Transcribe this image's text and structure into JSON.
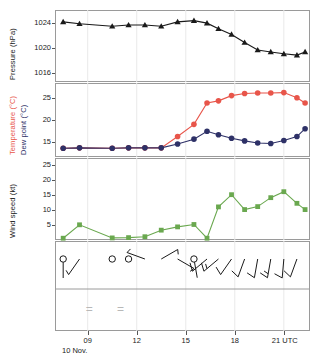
{
  "chart_data": {
    "type": "line",
    "title": "",
    "xlabel": "10 Nov.",
    "x_unit": "UTC",
    "x_tick_labels": [
      "09",
      "12",
      "15",
      "18",
      "21 UTC"
    ],
    "x_tick_hours": [
      9,
      12,
      15,
      18,
      21
    ],
    "xlim_hours": [
      7.0,
      22.6
    ],
    "date_label": "10 Nov.",
    "times_hours": [
      7.5,
      8.5,
      10.5,
      11.5,
      12.5,
      13.5,
      14.5,
      15.5,
      16.3,
      17.0,
      17.8,
      18.6,
      19.4,
      20.2,
      21.0,
      21.8,
      22.3
    ],
    "panels": [
      {
        "id": "pressure",
        "ylabel": "Pressure (hPa)",
        "yticks": [
          1016,
          1020,
          1024
        ],
        "ylim": [
          1014.5,
          1026.0
        ],
        "series": [
          {
            "name": "Pressure",
            "color": "#1a1a1a",
            "marker": "triangle",
            "values": [
              1024.1,
              1023.8,
              1023.4,
              1023.6,
              1023.6,
              1023.4,
              1024.1,
              1024.3,
              1023.9,
              1023.0,
              1022.1,
              1020.8,
              1019.6,
              1019.3,
              1019.0,
              1018.8,
              1019.3
            ]
          }
        ]
      },
      {
        "id": "temperature",
        "ylabel_1": "Temperature (°C)",
        "ylabel_2": "Dew point (°C)",
        "yticks": [
          15,
          20,
          25
        ],
        "ylim": [
          11.5,
          28.5
        ],
        "series": [
          {
            "name": "Temperature",
            "color": "#e8554a",
            "marker": "circle",
            "values": [
              13.5,
              13.6,
              13.5,
              13.6,
              13.6,
              13.6,
              16.2,
              19.0,
              23.9,
              24.4,
              25.6,
              26.1,
              26.2,
              26.2,
              26.3,
              25.1,
              23.9
            ]
          },
          {
            "name": "Dew point",
            "color": "#2e3167",
            "marker": "circle",
            "values": [
              13.5,
              13.6,
              13.5,
              13.6,
              13.6,
              13.6,
              14.5,
              15.6,
              17.4,
              16.6,
              15.8,
              15.2,
              14.7,
              14.6,
              15.3,
              16.2,
              18.0
            ]
          }
        ]
      },
      {
        "id": "windspeed",
        "ylabel": "Wind speed (kt)",
        "yticks": [
          5,
          10,
          15,
          20,
          25
        ],
        "ylim": [
          0,
          27.5
        ],
        "series": [
          {
            "name": "Wind speed",
            "color": "#6aa84f",
            "marker": "square",
            "values": [
              0.6,
              5.1,
              0.7,
              0.8,
              1.1,
              3.3,
              4.4,
              5.2,
              0.6,
              11.1,
              15.2,
              10.2,
              11.2,
              14.2,
              16.2,
              12.3,
              10.2
            ]
          }
        ]
      },
      {
        "id": "windbarbs",
        "ylabel": "",
        "barbs": [
          {
            "time": 7.5,
            "calm": true,
            "dir_deg": 180,
            "barbs_full": 0,
            "barbs_half": 1
          },
          {
            "time": 8.5,
            "calm": false,
            "dir_deg": 215,
            "barbs_full": 0,
            "barbs_half": 1
          },
          {
            "time": 10.5,
            "calm": true,
            "dir_deg": 0,
            "barbs_full": 0,
            "barbs_half": 0
          },
          {
            "time": 11.5,
            "calm": true,
            "dir_deg": 0,
            "barbs_full": 0,
            "barbs_half": 0
          },
          {
            "time": 12.5,
            "calm": false,
            "dir_deg": 290,
            "barbs_full": 0,
            "barbs_half": 1
          },
          {
            "time": 13.5,
            "calm": false,
            "dir_deg": 60,
            "barbs_full": 0,
            "barbs_half": 1
          },
          {
            "time": 14.5,
            "calm": false,
            "dir_deg": 120,
            "barbs_full": 0,
            "barbs_half": 1
          },
          {
            "time": 15.5,
            "calm": true,
            "dir_deg": 170,
            "barbs_full": 0,
            "barbs_half": 1
          },
          {
            "time": 16.3,
            "calm": false,
            "dir_deg": 230,
            "barbs_full": 1,
            "barbs_half": 0
          },
          {
            "time": 17.0,
            "calm": false,
            "dir_deg": 230,
            "barbs_full": 1,
            "barbs_half": 1
          },
          {
            "time": 17.8,
            "calm": false,
            "dir_deg": 215,
            "barbs_full": 1,
            "barbs_half": 0
          },
          {
            "time": 18.6,
            "calm": false,
            "dir_deg": 200,
            "barbs_full": 1,
            "barbs_half": 0
          },
          {
            "time": 19.4,
            "calm": false,
            "dir_deg": 190,
            "barbs_full": 1,
            "barbs_half": 0
          },
          {
            "time": 20.2,
            "calm": false,
            "dir_deg": 190,
            "barbs_full": 1,
            "barbs_half": 1
          },
          {
            "time": 21.0,
            "calm": false,
            "dir_deg": 185,
            "barbs_full": 1,
            "barbs_half": 0
          },
          {
            "time": 21.8,
            "calm": false,
            "dir_deg": 200,
            "barbs_full": 1,
            "barbs_half": 0
          }
        ],
        "weather_symbols": [
          {
            "time": 9.1,
            "symbol": "=",
            "label": "mist"
          },
          {
            "time": 11.0,
            "symbol": "=",
            "label": "mist"
          }
        ]
      }
    ],
    "grid": {
      "vertical": true,
      "horizontal": false
    },
    "legend": {
      "position": "axis-labels"
    }
  },
  "colors": {
    "temperature": "#e8554a",
    "dewpoint": "#2e3167",
    "windspeed": "#6aa84f",
    "pressure": "#1a1a1a",
    "frame": "#9a9a9a",
    "grid": "#e9e9e9",
    "weather_symbol": "#b8b8b8"
  }
}
